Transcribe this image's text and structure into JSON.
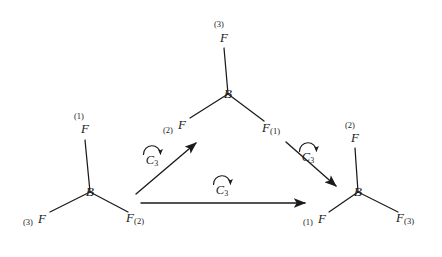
{
  "figure": {
    "type": "chemistry-symmetry-diagram",
    "background_color": "#ffffff",
    "stroke_color": "#1a1a1a",
    "text_color": "#1a1a1a"
  },
  "molecules": [
    {
      "id": "left",
      "center_label": "B",
      "center_x": 90,
      "center_y": 192,
      "substituents": [
        {
          "element": "F",
          "index": "(1)",
          "index_side": "pre-top",
          "label_x": 85,
          "label_y": 128,
          "prefix_x": 79,
          "prefix_y": 116,
          "bond_x2": 85,
          "bond_y2": 140
        },
        {
          "element": "F",
          "index": "(3)",
          "index_side": "pre",
          "label_x": 42,
          "label_y": 218,
          "prefix_x": 28,
          "prefix_y": 222,
          "bond_x2": 50,
          "bond_y2": 212
        },
        {
          "element": "F",
          "index": "(2)",
          "index_side": "post",
          "label_x": 135,
          "label_y": 218,
          "prefix_x": 0,
          "prefix_y": 0,
          "bond_x2": 128,
          "bond_y2": 212
        }
      ]
    },
    {
      "id": "top",
      "center_label": "B",
      "center_x": 228,
      "center_y": 94,
      "substituents": [
        {
          "element": "F",
          "index": "(3)",
          "index_side": "pre-top",
          "label_x": 224,
          "label_y": 37,
          "prefix_x": 219,
          "prefix_y": 24,
          "bond_x2": 224,
          "bond_y2": 48
        },
        {
          "element": "F",
          "index": "(2)",
          "index_side": "pre",
          "label_x": 182,
          "label_y": 124,
          "prefix_x": 168,
          "prefix_y": 130,
          "bond_x2": 190,
          "bond_y2": 118
        },
        {
          "element": "F",
          "index": "(1)",
          "index_side": "post",
          "label_x": 271,
          "label_y": 128,
          "prefix_x": 0,
          "prefix_y": 0,
          "bond_x2": 264,
          "bond_y2": 121
        }
      ]
    },
    {
      "id": "right",
      "center_label": "B",
      "center_x": 358,
      "center_y": 192,
      "substituents": [
        {
          "element": "F",
          "index": "(2)",
          "index_side": "pre-top",
          "label_x": 355,
          "label_y": 137,
          "prefix_x": 350,
          "prefix_y": 125,
          "bond_x2": 355,
          "bond_y2": 148
        },
        {
          "element": "F",
          "index": "(1)",
          "index_side": "pre",
          "label_x": 322,
          "label_y": 218,
          "prefix_x": 308,
          "prefix_y": 222,
          "bond_x2": 329,
          "bond_y2": 212
        },
        {
          "element": "F",
          "index": "(3)",
          "index_side": "post",
          "label_x": 405,
          "label_y": 218,
          "prefix_x": 0,
          "prefix_y": 0,
          "bond_x2": 398,
          "bond_y2": 212
        }
      ]
    }
  ],
  "operations": [
    {
      "id": "op-left-to-top",
      "symbol": "C",
      "subscript": "3",
      "label_x": 152,
      "label_y": 161,
      "arc_cx": 152,
      "arc_cy": 152,
      "arrow": {
        "x1": 136,
        "y1": 194,
        "x2": 196,
        "y2": 143
      }
    },
    {
      "id": "op-top-to-right",
      "symbol": "C",
      "subscript": "3",
      "label_x": 308,
      "label_y": 158,
      "arc_cx": 308,
      "arc_cy": 149,
      "arrow": {
        "x1": 286,
        "y1": 142,
        "x2": 336,
        "y2": 186
      }
    },
    {
      "id": "op-left-to-right",
      "symbol": "C",
      "subscript": "3",
      "label_x": 222,
      "label_y": 191,
      "arc_cx": 222,
      "arc_cy": 182,
      "arrow": {
        "x1": 141,
        "y1": 203,
        "x2": 305,
        "y2": 203
      }
    }
  ]
}
